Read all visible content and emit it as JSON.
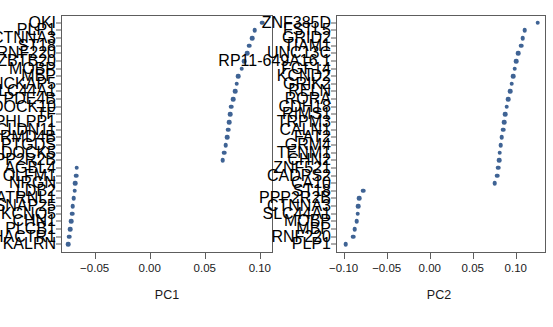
{
  "figure": {
    "panels": [
      {
        "id": "pc1",
        "axis_title": "PC1",
        "xlim": [
          -0.081,
          0.1115
        ],
        "xticks": [
          -0.05,
          0.0,
          0.05,
          0.1
        ],
        "xticklabels": [
          "−0.05",
          "0.00",
          "0.05",
          "0.10"
        ],
        "genes": [
          "QKI",
          "PLP1",
          "CTNNA3",
          "ST18",
          "RNF220",
          "ZBTB20",
          "MOBP",
          "MBP",
          "NCKAP5",
          "SLC44A1",
          "PDE4B",
          "DOCK10",
          "TF",
          "PHLPP1",
          "CLDN11",
          "FRMD4B",
          "PTGDS",
          "DOCK5",
          "PPP2R2B",
          "AGBL4",
          "OLFM1",
          "NRGN",
          "LDB2",
          "ATRNL1",
          "SNAP25",
          "KCNQ5",
          "CHN1",
          "PLCB1",
          "PHACTR1",
          "KALRN"
        ],
        "values": [
          0.1022,
          0.0955,
          0.093,
          0.0905,
          0.0885,
          0.086,
          0.0835,
          0.0805,
          0.079,
          0.0775,
          0.076,
          0.0742,
          0.073,
          0.0722,
          0.0712,
          0.0702,
          0.069,
          0.0678,
          0.0662,
          -0.0662,
          -0.0668,
          -0.0675,
          -0.0682,
          -0.069,
          -0.0698,
          -0.0706,
          -0.0714,
          -0.0722,
          -0.0731,
          -0.0742
        ]
      },
      {
        "id": "pc2",
        "axis_title": "PC2",
        "xlim": [
          -0.1095,
          0.1345
        ],
        "xticks": [
          -0.1,
          -0.05,
          0.0,
          0.05,
          0.1
        ],
        "xticklabels": [
          "−0.10",
          "−0.05",
          "0.00",
          "0.05",
          "0.10"
        ],
        "genes": [
          "ZNF385D",
          "FSTL5",
          "GRID2",
          "TIAM1",
          "UNC13C",
          "RP11-649A16.1",
          "FGF14",
          "KCND2",
          "GRIK2",
          "RELN",
          "RORA",
          "CDH18",
          "RIMS1",
          "TRPM3",
          "CALN1",
          "FAT2",
          "GRM4",
          "TENM1",
          "CHN2",
          "ZNF521",
          "CADPS2",
          "CA10",
          "ST18",
          "PPP2R2B",
          "CTNNA3",
          "SLC44A1",
          "MOBP",
          "MBP",
          "RNF220",
          "PLP1"
        ],
        "values": [
          0.1255,
          0.1105,
          0.108,
          0.106,
          0.103,
          0.1005,
          0.0985,
          0.0968,
          0.0952,
          0.0935,
          0.0912,
          0.0895,
          0.088,
          0.0868,
          0.0852,
          0.0838,
          0.0826,
          0.0815,
          0.0805,
          0.0795,
          0.0785,
          0.0755,
          -0.0772,
          -0.0818,
          -0.0828,
          -0.0838,
          -0.0848,
          -0.0872,
          -0.0888,
          -0.0978
        ]
      }
    ]
  },
  "chart_data": {
    "type": "scatter",
    "title": "",
    "xlabel": "PC1 / PC2 loading",
    "ylabel": "Gene",
    "grid": false,
    "legend": "none",
    "panels": [
      {
        "name": "PC1",
        "xlabel": "PC1",
        "ylabel": "",
        "xlim": [
          -0.081,
          0.1115
        ],
        "xticks": [
          -0.05,
          0.0,
          0.05,
          0.1
        ],
        "categories": [
          "QKI",
          "PLP1",
          "CTNNA3",
          "ST18",
          "RNF220",
          "ZBTB20",
          "MOBP",
          "MBP",
          "NCKAP5",
          "SLC44A1",
          "PDE4B",
          "DOCK10",
          "TF",
          "PHLPP1",
          "CLDN11",
          "FRMD4B",
          "PTGDS",
          "DOCK5",
          "PPP2R2B",
          "AGBL4",
          "OLFM1",
          "NRGN",
          "LDB2",
          "ATRNL1",
          "SNAP25",
          "KCNQ5",
          "CHN1",
          "PLCB1",
          "PHACTR1",
          "KALRN"
        ],
        "values": [
          0.1022,
          0.0955,
          0.093,
          0.0905,
          0.0885,
          0.086,
          0.0835,
          0.0805,
          0.079,
          0.0775,
          0.076,
          0.0742,
          0.073,
          0.0722,
          0.0712,
          0.0702,
          0.069,
          0.0678,
          0.0662,
          -0.0662,
          -0.0668,
          -0.0675,
          -0.0682,
          -0.069,
          -0.0698,
          -0.0706,
          -0.0714,
          -0.0722,
          -0.0731,
          -0.0742
        ]
      },
      {
        "name": "PC2",
        "xlabel": "PC2",
        "ylabel": "",
        "xlim": [
          -0.1095,
          0.1345
        ],
        "xticks": [
          -0.1,
          -0.05,
          0.0,
          0.05,
          0.1
        ],
        "categories": [
          "ZNF385D",
          "FSTL5",
          "GRID2",
          "TIAM1",
          "UNC13C",
          "RP11-649A16.1",
          "FGF14",
          "KCND2",
          "GRIK2",
          "RELN",
          "RORA",
          "CDH18",
          "RIMS1",
          "TRPM3",
          "CALN1",
          "FAT2",
          "GRM4",
          "TENM1",
          "CHN2",
          "ZNF521",
          "CADPS2",
          "CA10",
          "ST18",
          "PPP2R2B",
          "CTNNA3",
          "SLC44A1",
          "MOBP",
          "MBP",
          "RNF220",
          "PLP1"
        ],
        "values": [
          0.1255,
          0.1105,
          0.108,
          0.106,
          0.103,
          0.1005,
          0.0985,
          0.0968,
          0.0952,
          0.0935,
          0.0912,
          0.0895,
          0.088,
          0.0868,
          0.0852,
          0.0838,
          0.0826,
          0.0815,
          0.0805,
          0.0795,
          0.0785,
          0.0755,
          -0.0772,
          -0.0818,
          -0.0828,
          -0.0838,
          -0.0848,
          -0.0872,
          -0.0888,
          -0.0978
        ]
      }
    ],
    "marker_color": "#3f6394"
  }
}
